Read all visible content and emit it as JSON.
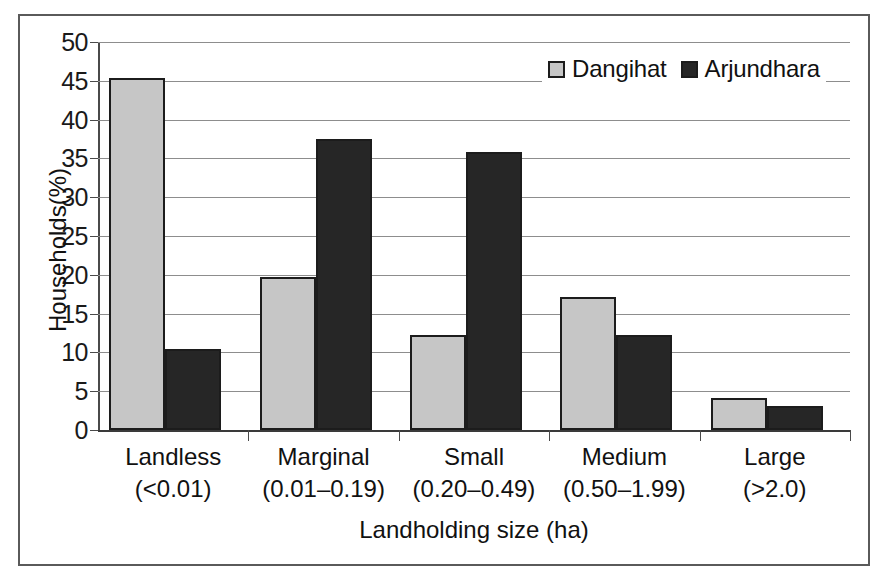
{
  "chart_data": {
    "type": "bar",
    "title": "",
    "xlabel": "Landholding size (ha)",
    "ylabel": "Households(%)",
    "categories": [
      "Landless",
      "Marginal",
      "Small",
      "Medium",
      "Large"
    ],
    "category_ranges": [
      "(<0.01)",
      "(0.01–0.19)",
      "(0.20–0.49)",
      "(0.50–1.99)",
      "(>2.0)"
    ],
    "series": [
      {
        "name": "Dangihat",
        "color": "#c6c6c6",
        "values": [
          45.4,
          19.7,
          12.3,
          17.2,
          4.1
        ]
      },
      {
        "name": "Arjundhara",
        "color": "#262626",
        "values": [
          10.5,
          37.5,
          35.8,
          12.2,
          3.1
        ]
      }
    ],
    "ylim": [
      0,
      50
    ],
    "ytick_labels": [
      "50",
      "45",
      "40",
      "35",
      "30",
      "25",
      "20",
      "15",
      "10",
      "5",
      "0"
    ],
    "ytick_values": [
      50,
      45,
      40,
      35,
      30,
      25,
      20,
      15,
      10,
      5,
      0
    ],
    "grid": true,
    "legend_position": "top-right-inside"
  },
  "axes": {
    "y_title": "Households(%)",
    "x_title": "Landholding size (ha)"
  },
  "legend": {
    "entries": [
      {
        "label": "Dangihat",
        "swatch": "legend-swatch-dangihat"
      },
      {
        "label": "Arjundhara",
        "swatch": "legend-swatch-arjundhara"
      }
    ]
  }
}
